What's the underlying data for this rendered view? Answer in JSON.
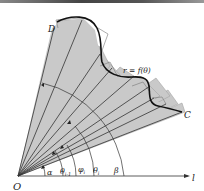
{
  "figure": {
    "origin_label": "O",
    "axis_label": "l",
    "curve_label": "r = f(θ)",
    "point_start_label": "C",
    "point_end_label": "D",
    "angle_labels": {
      "alpha": "α",
      "theta_prev": "θ",
      "theta_prev_sub": "i-1",
      "phi": "φ",
      "phi_sub": "i",
      "theta": "θ",
      "theta_sub": "i",
      "beta": "β"
    },
    "colors": {
      "sector_fill": "#c8c8c8",
      "line": "#333333",
      "curve": "#111111",
      "background": "#ffffff"
    }
  }
}
